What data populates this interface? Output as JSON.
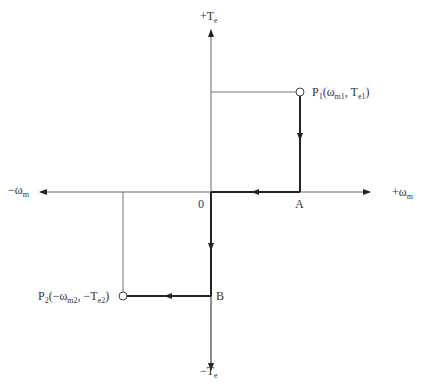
{
  "diagram": {
    "axes": {
      "y_pos": {
        "main": "+T",
        "sub": "e"
      },
      "y_neg": {
        "main": "−T",
        "sub": "e"
      },
      "x_pos": {
        "main": "+ω",
        "sub": "m"
      },
      "x_neg": {
        "main": "−ω",
        "sub": "m"
      },
      "origin": "0"
    },
    "points": {
      "p1": {
        "pre": "P",
        "sub1": "1",
        "open": "(ω",
        "sub2": "m1",
        "mid": ", T",
        "sub3": "e1",
        "close": ")"
      },
      "p2": {
        "pre": "P",
        "sub1": "2",
        "open": "(−ω",
        "sub2": "m2",
        "mid": ", −T",
        "sub3": "e2",
        "close": ")"
      },
      "a": "A",
      "b": "B"
    },
    "colors": {
      "axis": "#555555",
      "path": "#222222",
      "guide": "#777777"
    }
  }
}
